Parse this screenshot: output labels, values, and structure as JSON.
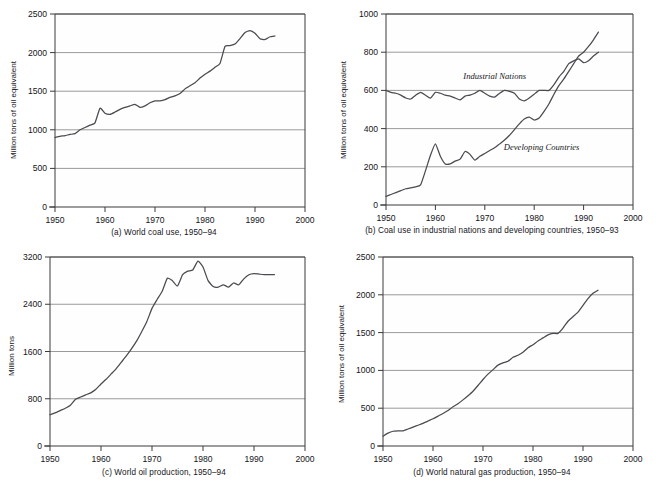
{
  "figure": {
    "title": "",
    "panel_count": 4
  },
  "chart_data": [
    {
      "id": "a",
      "type": "line",
      "title": "(a) World coal use, 1950–94",
      "caption": "(a) World coal use, 1950–94",
      "xlabel": "",
      "ylabel": "Million tons of oil equivalent",
      "xlim": [
        1950,
        2000
      ],
      "ylim": [
        0,
        2500
      ],
      "xticks": [
        1950,
        1960,
        1970,
        1980,
        1990,
        2000
      ],
      "yticks": [
        0,
        500,
        1000,
        1500,
        2000,
        2500
      ],
      "grid": "horizontal",
      "legend": "none",
      "x": [
        1950,
        1951,
        1952,
        1953,
        1954,
        1955,
        1956,
        1957,
        1958,
        1959,
        1960,
        1961,
        1962,
        1963,
        1964,
        1965,
        1966,
        1967,
        1968,
        1969,
        1970,
        1971,
        1972,
        1973,
        1974,
        1975,
        1976,
        1977,
        1978,
        1979,
        1980,
        1981,
        1982,
        1983,
        1984,
        1985,
        1986,
        1987,
        1988,
        1989,
        1990,
        1991,
        1992,
        1993,
        1994
      ],
      "values": [
        900,
        915,
        925,
        940,
        950,
        1000,
        1030,
        1060,
        1090,
        1280,
        1215,
        1200,
        1230,
        1265,
        1290,
        1310,
        1330,
        1290,
        1310,
        1350,
        1375,
        1375,
        1390,
        1420,
        1440,
        1470,
        1530,
        1570,
        1610,
        1670,
        1720,
        1760,
        1810,
        1860,
        2080,
        2090,
        2110,
        2180,
        2260,
        2285,
        2250,
        2180,
        2170,
        2205,
        2215
      ]
    },
    {
      "id": "b",
      "type": "line",
      "title": "(b) Coal use in industrial nations and developing countries, 1950–93",
      "caption": "(b) Coal use in industrial nations and developing countries, 1950–93",
      "xlabel": "",
      "ylabel": "Million tons of oil equivalent",
      "xlim": [
        1950,
        2000
      ],
      "ylim": [
        0,
        1000
      ],
      "xticks": [
        1950,
        1960,
        1970,
        1980,
        1990,
        2000
      ],
      "yticks": [
        0,
        200,
        400,
        600,
        800,
        1000
      ],
      "grid": "horizontal",
      "legend": "inline-labels",
      "x": [
        1950,
        1951,
        1952,
        1953,
        1954,
        1955,
        1956,
        1957,
        1958,
        1959,
        1960,
        1961,
        1962,
        1963,
        1964,
        1965,
        1966,
        1967,
        1968,
        1969,
        1970,
        1971,
        1972,
        1973,
        1974,
        1975,
        1976,
        1977,
        1978,
        1979,
        1980,
        1981,
        1982,
        1983,
        1984,
        1985,
        1986,
        1987,
        1988,
        1989,
        1990,
        1991,
        1992,
        1993
      ],
      "series": [
        {
          "name": "Industrial Nations",
          "label": "Industrial Nations",
          "values": [
            600,
            590,
            585,
            575,
            560,
            555,
            575,
            590,
            575,
            560,
            590,
            585,
            575,
            570,
            560,
            550,
            570,
            575,
            585,
            600,
            585,
            570,
            565,
            585,
            600,
            595,
            585,
            555,
            545,
            560,
            580,
            600,
            600,
            600,
            630,
            670,
            700,
            740,
            755,
            765,
            745,
            755,
            780,
            800
          ]
        },
        {
          "name": "Developing Countries",
          "label": "Developing Countries",
          "values": [
            45,
            55,
            65,
            75,
            85,
            90,
            95,
            105,
            180,
            260,
            320,
            255,
            215,
            215,
            230,
            240,
            280,
            265,
            235,
            255,
            270,
            285,
            300,
            320,
            340,
            365,
            395,
            425,
            450,
            460,
            445,
            455,
            490,
            530,
            580,
            625,
            660,
            700,
            740,
            780,
            800,
            830,
            865,
            905
          ]
        }
      ]
    },
    {
      "id": "c",
      "type": "line",
      "title": "(c) World oil production, 1950–94",
      "caption": "(c) World oil production, 1950–94",
      "xlabel": "",
      "ylabel": "Million tons",
      "xlim": [
        1950,
        2000
      ],
      "ylim": [
        0,
        3200
      ],
      "xticks": [
        1950,
        1960,
        1970,
        1980,
        1990,
        2000
      ],
      "yticks": [
        0,
        800,
        1600,
        2400,
        3200
      ],
      "grid": "horizontal",
      "legend": "none",
      "x": [
        1950,
        1951,
        1952,
        1953,
        1954,
        1955,
        1956,
        1957,
        1958,
        1959,
        1960,
        1961,
        1962,
        1963,
        1964,
        1965,
        1966,
        1967,
        1968,
        1969,
        1970,
        1971,
        1972,
        1973,
        1974,
        1975,
        1976,
        1977,
        1978,
        1979,
        1980,
        1981,
        1982,
        1983,
        1984,
        1985,
        1986,
        1987,
        1988,
        1989,
        1990,
        1991,
        1992,
        1993,
        1994
      ],
      "values": [
        530,
        560,
        600,
        640,
        690,
        790,
        830,
        865,
        900,
        960,
        1050,
        1130,
        1220,
        1310,
        1420,
        1530,
        1650,
        1780,
        1940,
        2110,
        2330,
        2480,
        2620,
        2840,
        2800,
        2710,
        2900,
        2960,
        2980,
        3130,
        3030,
        2800,
        2700,
        2690,
        2730,
        2690,
        2760,
        2730,
        2830,
        2900,
        2920,
        2910,
        2900,
        2900,
        2900
      ]
    },
    {
      "id": "d",
      "type": "line",
      "title": "(d) World natural gas production, 1950–94",
      "caption": "(d) World natural gas production, 1950–94",
      "xlabel": "",
      "ylabel": "Million tons of oil equivalent",
      "xlim": [
        1950,
        2000
      ],
      "ylim": [
        0,
        2500
      ],
      "xticks": [
        1950,
        1960,
        1970,
        1980,
        1990,
        2000
      ],
      "yticks": [
        0,
        500,
        1000,
        1500,
        2000,
        2500
      ],
      "grid": "horizontal",
      "legend": "none",
      "x": [
        1950,
        1951,
        1952,
        1953,
        1954,
        1955,
        1956,
        1957,
        1958,
        1959,
        1960,
        1961,
        1962,
        1963,
        1964,
        1965,
        1966,
        1967,
        1968,
        1969,
        1970,
        1971,
        1972,
        1973,
        1974,
        1975,
        1976,
        1977,
        1978,
        1979,
        1980,
        1981,
        1982,
        1983,
        1984,
        1985,
        1986,
        1987,
        1988,
        1989,
        1990,
        1991,
        1992,
        1993,
        1994
      ],
      "values": [
        130,
        170,
        195,
        200,
        200,
        225,
        250,
        275,
        300,
        330,
        360,
        395,
        430,
        470,
        520,
        560,
        610,
        665,
        725,
        800,
        880,
        950,
        1010,
        1070,
        1100,
        1120,
        1175,
        1200,
        1240,
        1300,
        1340,
        1390,
        1430,
        1470,
        1490,
        1490,
        1560,
        1650,
        1710,
        1770,
        1860,
        1950,
        2020,
        2060,
        2100,
        2140
      ]
    }
  ],
  "panels": {
    "a": {
      "caption": "(a) World coal use, 1950–94",
      "ylabel": "Million tons of oil equivalent"
    },
    "b": {
      "caption": "(b) Coal use in industrial nations and developing countries, 1950–93",
      "ylabel": "Million tons of oil equivalent",
      "label_industrial": "Industrial Nations",
      "label_developing": "Developing Countries"
    },
    "c": {
      "caption": "(c) World oil production, 1950–94",
      "ylabel": "Million tons"
    },
    "d": {
      "caption": "(d) World natural gas production, 1950–94",
      "ylabel": "Million tons of oil equivalent"
    }
  },
  "colors": {
    "curve": "#4a4a50",
    "gridline": "#8e8e8e",
    "axis": "#3a3a3a",
    "text": "#15151a",
    "background": "#ffffff"
  }
}
